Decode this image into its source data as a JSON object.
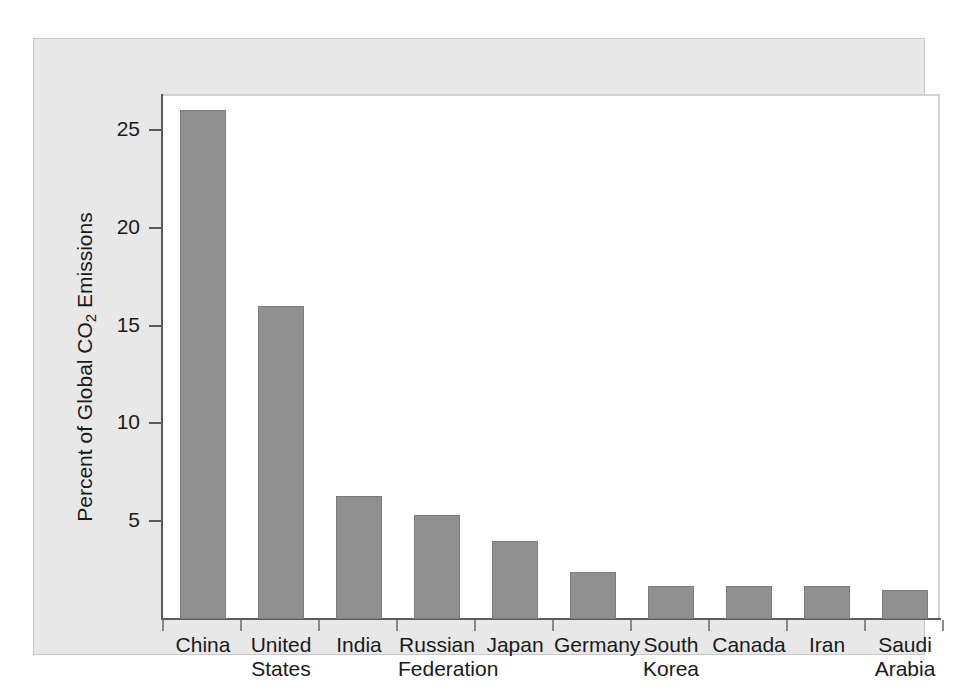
{
  "chart_data": {
    "type": "bar",
    "title": "",
    "xlabel": "",
    "ylabel": "Percent of Global CO2 Emissions",
    "ylabel_parts": {
      "before": "Percent of Global CO",
      "subscript": "2",
      "after": " Emissions"
    },
    "categories": [
      "China",
      "United States",
      "India",
      "Russian Federation",
      "Japan",
      "Germany",
      "South Korea",
      "Canada",
      "Iran",
      "Saudi Arabia"
    ],
    "category_lines": [
      [
        "China"
      ],
      [
        "United",
        "States"
      ],
      [
        "India"
      ],
      [
        "Russian",
        "Federation"
      ],
      [
        "Japan"
      ],
      [
        "Germany"
      ],
      [
        "South",
        "Korea"
      ],
      [
        "Canada"
      ],
      [
        "Iran"
      ],
      [
        "Saudi",
        "Arabia"
      ]
    ],
    "values": [
      26.0,
      16.0,
      6.3,
      5.3,
      4.0,
      2.4,
      1.7,
      1.7,
      1.7,
      1.5
    ],
    "ylim": [
      0,
      27
    ],
    "yticks": [
      5,
      10,
      15,
      20,
      25
    ],
    "ytick_labels": [
      "5",
      "10",
      "15",
      "20",
      "25"
    ],
    "grid": false,
    "legend": null,
    "bar_color": "#909090",
    "bar_edge_color": "#7c7c7c",
    "panel_color": "#e8e8e8",
    "plot_background": "#ffffff",
    "axis_color": "#5a5a5a",
    "text_color": "#1a1a1a"
  }
}
